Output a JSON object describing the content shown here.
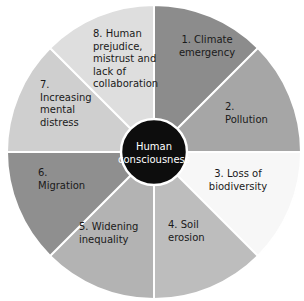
{
  "center": {
    "label_lines": [
      "Human",
      "consciousness"
    ],
    "color": "#0d0d0d"
  },
  "segments": [
    {
      "number": "1.",
      "label_lines": [
        "1.  Climate",
        "emergency"
      ],
      "color": "#8c8c8c"
    },
    {
      "number": "2.",
      "label_lines": [
        "2.",
        "Pollution"
      ],
      "color": "#a6a6a6"
    },
    {
      "number": "3.",
      "label_lines": [
        "3.  Loss of",
        "biodiversity"
      ],
      "color": "#f7f7f7"
    },
    {
      "number": "4.",
      "label_lines": [
        "4.  Soil",
        "erosion"
      ],
      "color": "#bdbdbd"
    },
    {
      "number": "5.",
      "label_lines": [
        "5.  Widening",
        "inequality"
      ],
      "color": "#b3b3b3"
    },
    {
      "number": "6.",
      "label_lines": [
        "6.",
        "Migration"
      ],
      "color": "#8f8f8f"
    },
    {
      "number": "7.",
      "label_lines": [
        "7.",
        "Increasing",
        "mental",
        "distress"
      ],
      "color": "#cfcfcf"
    },
    {
      "number": "8.",
      "label_lines": [
        "8.  Human",
        "prejudice,",
        "mistrust and",
        "lack of",
        "collaboration"
      ],
      "color": "#dedede"
    }
  ]
}
